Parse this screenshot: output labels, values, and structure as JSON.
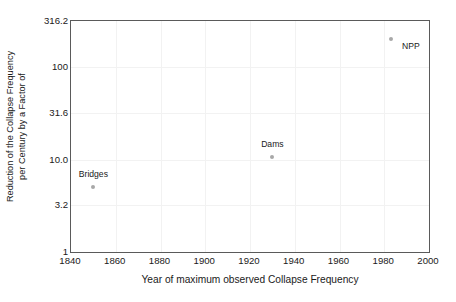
{
  "chart_data": {
    "type": "scatter",
    "title": "",
    "xlabel": "Year of maximum observed Collapse Frequency",
    "ylabel_line1": "Reduction of the Collapse Frequency",
    "ylabel_line2": "per Century by a Factor of",
    "xlim": [
      1840,
      2000
    ],
    "ylim": [
      1,
      316.2
    ],
    "yscale": "log",
    "xscale": "linear",
    "grid": true,
    "legend": "none",
    "xticks": [
      "1840",
      "1860",
      "1880",
      "1900",
      "1920",
      "1940",
      "1960",
      "1980",
      "2000"
    ],
    "xtick_values": [
      1840,
      1860,
      1880,
      1900,
      1920,
      1940,
      1960,
      1980,
      2000
    ],
    "yticks": [
      "1",
      "3.2",
      "10.0",
      "31.6",
      "100",
      "316.2"
    ],
    "ytick_values": [
      1,
      3.2,
      10.0,
      31.6,
      100,
      316.2
    ],
    "points": [
      {
        "label": "Bridges",
        "x": 1850,
        "y": 5.0,
        "label_dx": 0,
        "label_dy": -13
      },
      {
        "label": "Dams",
        "x": 1930,
        "y": 10.7,
        "label_dx": 0,
        "label_dy": -13
      },
      {
        "label": "NPP",
        "x": 1983,
        "y": 200.0,
        "label_dx": 20,
        "label_dy": 7
      }
    ],
    "marker_color": "#a8a8a8",
    "grid_color": "#f2f2f2",
    "axis_color": "#5a5a5a",
    "text_color": "#1a1a1a",
    "background_color": "#ffffff"
  }
}
